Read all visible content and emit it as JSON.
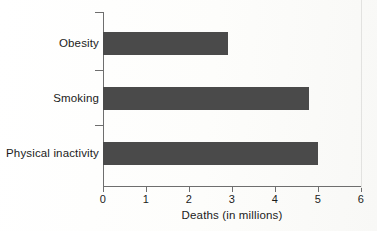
{
  "chart_data": {
    "type": "bar",
    "orientation": "horizontal",
    "title": "",
    "xlabel": "Deaths (in millions)",
    "ylabel": "",
    "categories": [
      "Obesity",
      "Smoking",
      "Physical inactivity"
    ],
    "values": [
      2.9,
      4.8,
      5.0
    ],
    "series": [
      {
        "name": "Deaths (in millions)",
        "values": [
          2.9,
          4.8,
          5.0
        ]
      }
    ],
    "xlim": [
      0,
      6
    ],
    "xticks": [
      0,
      1,
      2,
      3,
      4,
      5,
      6
    ],
    "xtick_labels": [
      "0",
      "1",
      "2",
      "3",
      "4",
      "5",
      "6"
    ],
    "grid": false,
    "legend": false,
    "bar_color": "#4a4a4a",
    "axis_color": "#6e6e6e",
    "background_color": "#fdfdfc"
  },
  "axis": {
    "x_title": "Deaths (in millions)",
    "tick_0": "0",
    "tick_1": "1",
    "tick_2": "2",
    "tick_3": "3",
    "tick_4": "4",
    "tick_5": "5",
    "tick_6": "6"
  },
  "categories": {
    "obesity": "Obesity",
    "smoking": "Smoking",
    "physical_inactivity": "Physical inactivity"
  }
}
